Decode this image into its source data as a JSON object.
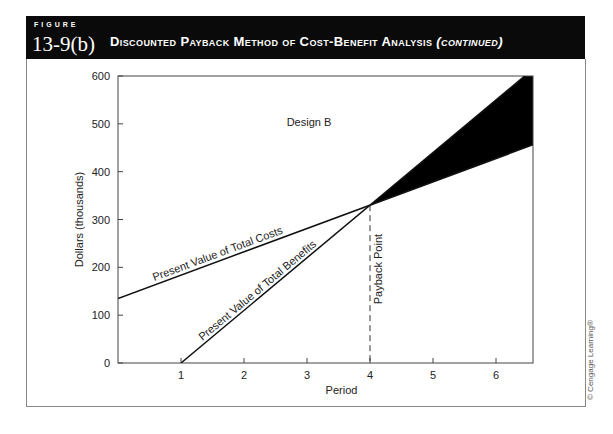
{
  "figure": {
    "kicker": "FIGURE",
    "number": "13-9(b)",
    "title": "Discounted Payback Method of Cost-Benefit Analysis",
    "title_suffix": "(continued)",
    "credit": "© Cengage Learning®"
  },
  "colors": {
    "header_bg": "#0a0a0a",
    "line": "#111111",
    "area_fill": "#000000",
    "frame": "#888888"
  },
  "chart_data": {
    "type": "line",
    "title": "Design B",
    "xlabel": "Period",
    "ylabel": "Dollars (thousands)",
    "xlim": [
      0,
      6.6
    ],
    "ylim": [
      0,
      600
    ],
    "x_ticks": [
      1,
      2,
      3,
      4,
      5,
      6
    ],
    "y_ticks": [
      0,
      100,
      200,
      300,
      400,
      500,
      600
    ],
    "grid": false,
    "series": [
      {
        "name": "Present Value of Total Costs",
        "x": [
          0,
          4,
          6.6
        ],
        "values": [
          135,
          330,
          456
        ]
      },
      {
        "name": "Present Value of Total Benefits",
        "x": [
          1,
          4,
          6.6
        ],
        "values": [
          0,
          330,
          600
        ]
      }
    ],
    "annotations": [
      {
        "text": "Payback Point",
        "x": 4,
        "y": 330,
        "style": "dashed vertical line to x-axis"
      },
      {
        "text": "Design B",
        "x": 3,
        "y": 500
      },
      {
        "text": "Shaded region: net benefit after payback",
        "x_range": [
          4,
          6.6
        ]
      }
    ],
    "payback_point": {
      "period": 4,
      "value": 330
    }
  }
}
